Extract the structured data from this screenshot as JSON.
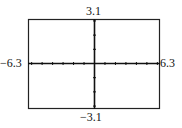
{
  "window": {
    "xmin": "-6.3",
    "xmax": "6.3",
    "ymin": "-3.1",
    "ymax": "3.1",
    "xmin_label": "−6.3",
    "xmax_label": "6.3",
    "ymin_label": "−3.1",
    "ymax_label": "3.1",
    "x_ticks_per_side": 6,
    "y_ticks_per_side": 3
  },
  "colors": {
    "frame": "#222222",
    "axis": "#111111"
  }
}
